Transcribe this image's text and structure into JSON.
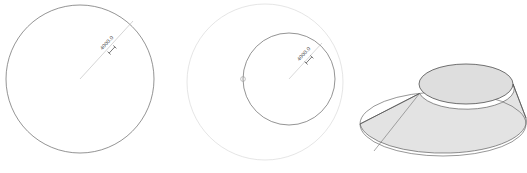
{
  "viewport": {
    "name": "cad-viewport",
    "width": 527,
    "height": 173,
    "background_color": "#ffffff"
  },
  "style": {
    "primary_line_color": "#5a5a5a",
    "faint_line_color": "#cfcfcf",
    "construction_line_color": "#c8c8c8",
    "dimension_text_color": "#4c4c4c",
    "solid_fill_color": "#e0e0e0",
    "solid_edge_color": "#555555",
    "solid_highlight_color": "#d6d6d6"
  },
  "views": [
    {
      "id": "view-left",
      "name": "large-circle-view",
      "type": "circle-with-radius-dimension",
      "circle": {
        "center_x": 80,
        "center_y": 79,
        "radius": 74,
        "stroke": "#5a5a5a"
      },
      "dimension": {
        "label": "4000.0",
        "leader_start_x": 80,
        "leader_start_y": 79,
        "leader_end_x": 133,
        "leader_end_y": 21,
        "text_x": 108,
        "text_y": 44,
        "text_rotation": -47,
        "tick_x": 112,
        "tick_y": 50
      }
    },
    {
      "id": "view-middle",
      "name": "nested-circle-view",
      "type": "circle-with-radius-dimension",
      "outer_circle": {
        "center_x": 265,
        "center_y": 82,
        "radius": 78,
        "stroke": "#cfcfcf"
      },
      "circle": {
        "center_x": 289,
        "center_y": 79,
        "radius": 46,
        "stroke": "#5a5a5a"
      },
      "grip": {
        "name": "edit-grip-handle",
        "x": 243,
        "y": 79,
        "radius": 2.4
      },
      "dimension": {
        "label": "4000.0",
        "leader_start_x": 289,
        "leader_start_y": 79,
        "leader_end_x": 322,
        "leader_end_y": 43,
        "text_x": 305,
        "text_y": 55,
        "text_rotation": -47,
        "tick_x": 309,
        "tick_y": 60
      }
    },
    {
      "id": "view-right",
      "name": "frustum-solid-view",
      "type": "shaded-3d-solid",
      "solid_name": "truncated-cone",
      "base_ellipse": {
        "center_x": 443,
        "center_y": 124,
        "radius_x": 83,
        "radius_y": 32
      },
      "top_ellipse": {
        "center_x": 466,
        "center_y": 84,
        "radius_x": 47,
        "radius_y": 20
      }
    }
  ]
}
